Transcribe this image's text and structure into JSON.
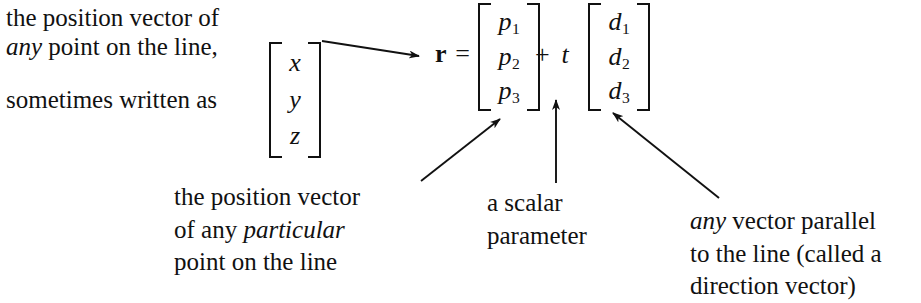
{
  "figure": {
    "background_color": "#ffffff",
    "ink_color": "#111111"
  },
  "intro": {
    "line1": "the position vector of",
    "line2_italic": "any",
    "line2_rest": " point on the line,",
    "line3": "sometimes written as"
  },
  "vectors": {
    "coordinate": {
      "name": "xyz-column-vector",
      "entries": [
        "x",
        "y",
        "z"
      ]
    },
    "position": {
      "name": "p-column-vector",
      "symbol": "p",
      "entries": [
        {
          "base": "p",
          "sub": "1"
        },
        {
          "base": "p",
          "sub": "2"
        },
        {
          "base": "p",
          "sub": "3"
        }
      ]
    },
    "direction": {
      "name": "d-column-vector",
      "symbol": "d",
      "entries": [
        {
          "base": "d",
          "sub": "1"
        },
        {
          "base": "d",
          "sub": "2"
        },
        {
          "base": "d",
          "sub": "3"
        }
      ]
    }
  },
  "equation": {
    "lhs_symbol": "r",
    "equals": "=",
    "plus": "+",
    "scalar": "t",
    "full_text": "r = [p1 p2 p3] + t[d1 d2 d3]"
  },
  "captions": {
    "position_vector": {
      "line1": "the position vector",
      "line2_prefix": "of any ",
      "line2_italic": "particular",
      "line3": "point on the line"
    },
    "scalar": {
      "line1": "a scalar",
      "line2": "parameter"
    },
    "direction": {
      "line1_italic": "any",
      "line1_rest": " vector parallel",
      "line2": "to the line (called a",
      "line3": "direction vector)"
    }
  },
  "arrows": [
    {
      "name": "arrow-intro-to-equation",
      "from": [
        322,
        41
      ],
      "to": [
        419,
        56
      ],
      "points_to": "r"
    },
    {
      "name": "arrow-position-caption-to-p-vector",
      "from": [
        421,
        181
      ],
      "to": [
        500,
        119
      ],
      "points_to": "p-column-vector"
    },
    {
      "name": "arrow-scalar-caption-to-t",
      "from": [
        556,
        183
      ],
      "to": [
        556,
        100
      ],
      "points_to": "t"
    },
    {
      "name": "arrow-direction-caption-to-d-vector",
      "from": [
        719,
        198
      ],
      "to": [
        613,
        113
      ],
      "points_to": "d-column-vector"
    }
  ]
}
